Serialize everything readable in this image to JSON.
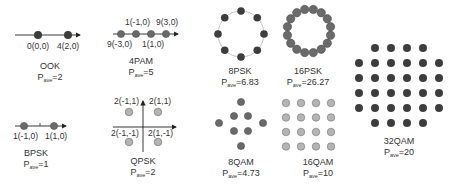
{
  "colors": {
    "dark_point": "#3d3d3d",
    "mid_point": "#6a6a6a",
    "light_point": "#b4b4b4",
    "axis": "#222222",
    "ring": "#aaaaaa",
    "text": "#333333"
  },
  "diagrams": {
    "ook": {
      "title": "OOK",
      "pave_label": "P",
      "pave_sub": "ave",
      "pave_value": "=2",
      "points": [
        {
          "label": "0(0,0)"
        },
        {
          "label": "4(2,0)"
        }
      ]
    },
    "pam4": {
      "title": "4PAM",
      "pave_label": "P",
      "pave_sub": "ave",
      "pave_value": "=5",
      "points": [
        {
          "label": "9(-3,0)"
        },
        {
          "label": "1(-1,0)"
        },
        {
          "label": "1(1,0)"
        },
        {
          "label": "9(3,0)"
        }
      ]
    },
    "bpsk": {
      "title": "BPSK",
      "pave_label": "P",
      "pave_sub": "ave",
      "pave_value": "=1",
      "points": [
        {
          "label": "1(-1,0)"
        },
        {
          "label": "1(1,0)"
        }
      ]
    },
    "qpsk": {
      "title": "QPSK",
      "pave_label": "P",
      "pave_sub": "ave",
      "pave_value": "=2",
      "points": [
        {
          "label": "2(-1,1)"
        },
        {
          "label": "2(1,1)"
        },
        {
          "label": "2(-1,-1)"
        },
        {
          "label": "2(1,-1)"
        }
      ]
    },
    "psk8": {
      "title": "8PSK",
      "pave_label": "P",
      "pave_sub": "ave",
      "pave_value": "=6.83"
    },
    "psk16": {
      "title": "16PSK",
      "pave_label": "P",
      "pave_sub": "ave",
      "pave_value": "=26.27"
    },
    "qam8": {
      "title": "8QAM",
      "pave_label": "P",
      "pave_sub": "ave",
      "pave_value": "=4.73"
    },
    "qam16": {
      "title": "16QAM",
      "pave_label": "P",
      "pave_sub": "ave",
      "pave_value": "=10"
    },
    "qam32": {
      "title": "32QAM",
      "pave_label": "P",
      "pave_sub": "ave",
      "pave_value": "=20"
    }
  }
}
